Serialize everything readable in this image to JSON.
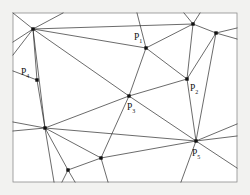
{
  "figure": {
    "background_color": "#f2f2f0",
    "panel_color": "#ffffff",
    "frame_color": "#8d8d8d",
    "edge_color": "#2b2b2b",
    "vertex_color": "#111111",
    "frame": {
      "x": 13,
      "y": 13,
      "width": 224,
      "height": 169
    }
  },
  "chart_data": {
    "type": "diagram",
    "subtype": "planar-graph-triangulation",
    "xlabel": "",
    "ylabel": "",
    "grid": false,
    "legend": "none",
    "xlim": [
      13,
      237
    ],
    "ylim": [
      13,
      182
    ],
    "labeled_points": [
      {
        "id": "P1",
        "label": "P",
        "subscript": "1",
        "x": 146,
        "y": 48,
        "label_x": 134,
        "label_y": 40
      },
      {
        "id": "P2",
        "label": "P",
        "subscript": "2",
        "x": 187,
        "y": 79,
        "label_x": 190,
        "label_y": 91
      },
      {
        "id": "P3",
        "label": "P",
        "subscript": "3",
        "x": 129,
        "y": 96,
        "label_x": 127,
        "label_y": 110
      },
      {
        "id": "P4",
        "label": "P",
        "subscript": "4",
        "x": 37,
        "y": 80,
        "label_x": 21,
        "label_y": 75
      },
      {
        "id": "P5",
        "label": "P",
        "subscript": "5",
        "x": 196,
        "y": 141,
        "label_x": 192,
        "label_y": 156
      }
    ],
    "vertices": [
      {
        "id": "V1",
        "x": 33,
        "y": 29
      },
      {
        "id": "V2",
        "x": 37,
        "y": 80
      },
      {
        "id": "V3",
        "x": 45,
        "y": 128
      },
      {
        "id": "V4",
        "x": 68,
        "y": 170
      },
      {
        "id": "V5",
        "x": 101,
        "y": 158
      },
      {
        "id": "V6",
        "x": 129,
        "y": 96
      },
      {
        "id": "V7",
        "x": 146,
        "y": 48
      },
      {
        "id": "V8",
        "x": 187,
        "y": 79
      },
      {
        "id": "V9",
        "x": 193,
        "y": 24
      },
      {
        "id": "V10",
        "x": 216,
        "y": 33
      },
      {
        "id": "V11",
        "x": 196,
        "y": 141
      }
    ],
    "edges": [
      [
        "V1",
        "V2"
      ],
      [
        "V1",
        "V7"
      ],
      [
        "V1",
        "V9"
      ],
      [
        "V1",
        "V3"
      ],
      [
        "V1",
        "V6"
      ],
      [
        "V2",
        "V3"
      ],
      [
        "V3",
        "V4"
      ],
      [
        "V3",
        "V5"
      ],
      [
        "V3",
        "V6"
      ],
      [
        "V3",
        "V11"
      ],
      [
        "V4",
        "V5"
      ],
      [
        "V5",
        "V6"
      ],
      [
        "V5",
        "V11"
      ],
      [
        "V6",
        "V7"
      ],
      [
        "V6",
        "V8"
      ],
      [
        "V6",
        "V11"
      ],
      [
        "V7",
        "V8"
      ],
      [
        "V7",
        "V9"
      ],
      [
        "V8",
        "V9"
      ],
      [
        "V8",
        "V10"
      ],
      [
        "V8",
        "V11"
      ],
      [
        "V9",
        "V10"
      ],
      [
        "V10",
        "V11"
      ]
    ],
    "boundary_rays": [
      {
        "from": "V1",
        "to_x": 13,
        "to_y": 13
      },
      {
        "from": "V1",
        "to_x": 63,
        "to_y": 13
      },
      {
        "from": "V1",
        "to_x": 13,
        "to_y": 55
      },
      {
        "from": "V1",
        "to_x": 13,
        "to_y": 42
      },
      {
        "from": "V2",
        "to_x": 13,
        "to_y": 71
      },
      {
        "from": "V3",
        "to_x": 13,
        "to_y": 122
      },
      {
        "from": "V3",
        "to_x": 54,
        "to_y": 182
      },
      {
        "from": "V4",
        "to_x": 62,
        "to_y": 182
      },
      {
        "from": "V4",
        "to_x": 75,
        "to_y": 182
      },
      {
        "from": "V5",
        "to_x": 108,
        "to_y": 182
      },
      {
        "from": "V7",
        "to_x": 137,
        "to_y": 13
      },
      {
        "from": "V9",
        "to_x": 184,
        "to_y": 13
      },
      {
        "from": "V9",
        "to_x": 200,
        "to_y": 13
      },
      {
        "from": "V10",
        "to_x": 237,
        "to_y": 28
      },
      {
        "from": "V10",
        "to_x": 237,
        "to_y": 39
      },
      {
        "from": "V11",
        "to_x": 237,
        "to_y": 124
      },
      {
        "from": "V11",
        "to_x": 237,
        "to_y": 136
      },
      {
        "from": "V11",
        "to_x": 237,
        "to_y": 168
      },
      {
        "from": "V11",
        "to_x": 181,
        "to_y": 182
      },
      {
        "from": "V3",
        "to_x": 13,
        "to_y": 131
      }
    ]
  }
}
